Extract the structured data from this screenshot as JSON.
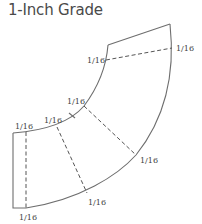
{
  "diagram": {
    "title": "1-Inch Grade",
    "colors": {
      "line": "#6e6e6e",
      "text": "#444444",
      "title": "#4a4a4a"
    },
    "pieces": [
      {
        "name": "top-piece",
        "fold_label_inner": "1/16",
        "fold_label_outer": "1/16"
      },
      {
        "name": "middle-piece",
        "fold_label_inner": "1/16",
        "fold_label_outer": "1/16"
      },
      {
        "name": "lower-piece",
        "fold_label_inner": "1/16",
        "fold_label_outer": "1/16"
      },
      {
        "name": "end-piece",
        "fold_label_top": "1/16",
        "fold_label_bottom": "1/16"
      }
    ],
    "labels": {
      "top_outer": "1/16",
      "top_inner": "1/16",
      "mid_inner": "1/16",
      "mid_outer": "1/16",
      "low_inner": "1/16",
      "low_outer": "1/16",
      "end_top": "1/16",
      "end_bottom": "1/16"
    }
  }
}
